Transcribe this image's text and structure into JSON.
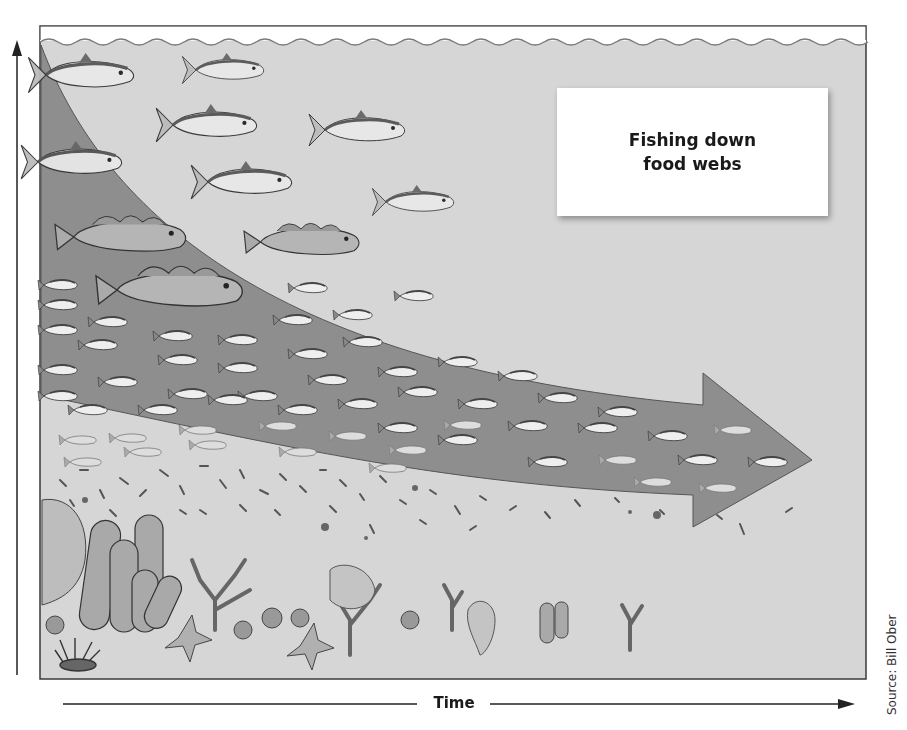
{
  "figure": {
    "title_line1": "Fishing down",
    "title_line2": "food webs",
    "x_axis_label": "Time",
    "y_axis_label": "",
    "credit": "Source: Bill Ober"
  },
  "colors": {
    "water": "#d6d6d6",
    "arrow_fill": "#8e8e8e",
    "frame": "#3a3a3a",
    "surface_line": "#7a7a7a",
    "text": "#1a1a1a"
  },
  "trophic_levels": [
    {
      "name": "large-predatory-fish",
      "depicted_as": "tuna"
    },
    {
      "name": "medium-predatory-fish",
      "depicted_as": "cod"
    },
    {
      "name": "small-pelagic-fish",
      "depicted_as": "sardines/anchovies"
    },
    {
      "name": "invertebrates-plankton",
      "depicted_as": "krill, zooplankton"
    },
    {
      "name": "benthos",
      "depicted_as": "sponges, corals, sea stars, anemones, urchins"
    }
  ]
}
